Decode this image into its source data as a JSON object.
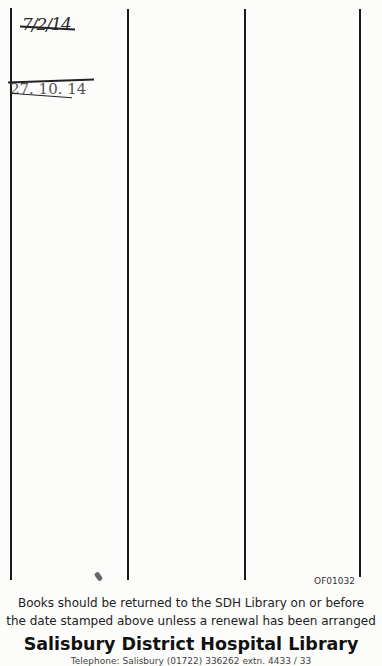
{
  "document": {
    "type": "library date-due slip",
    "columns": 4,
    "handwritten_entries": [
      {
        "text": "7/2/14",
        "struck_through": true
      },
      {
        "text": "27. 10. 14",
        "struck_through": true
      }
    ],
    "form_code": "OF01032",
    "notice_line_1": "Books should be returned to the SDH Library on or before",
    "notice_line_2": "the date stamped above unless a renewal has been arranged",
    "library_name": "Salisbury District Hospital Library",
    "footer_partial": "Telephone: Salisbury (01722) 336262 extn. 4433 / 33"
  }
}
